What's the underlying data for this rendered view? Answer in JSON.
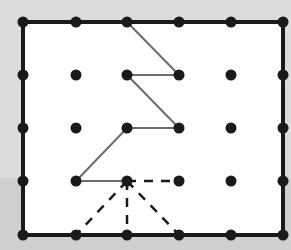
{
  "diagram": {
    "type": "dot-grid-path",
    "grid": {
      "columns": [
        23,
        76,
        127,
        179,
        231,
        283
      ],
      "rows": [
        22,
        75,
        128,
        181,
        235
      ]
    },
    "frame": {
      "x1": 23,
      "y1": 22,
      "x2": 283,
      "y2": 235,
      "stroke": "#1a1a1a",
      "width": 4
    },
    "dot_color": "#1a1a1a",
    "dot_radius": 5.5,
    "solid_path": [
      [
        127,
        22
      ],
      [
        179,
        75
      ],
      [
        127,
        75
      ],
      [
        179,
        128
      ],
      [
        127,
        128
      ],
      [
        76,
        181
      ],
      [
        127,
        181
      ]
    ],
    "solid_color": "#6a6a6a",
    "dashed_segments": [
      [
        [
          127,
          181
        ],
        [
          179,
          181
        ]
      ],
      [
        [
          127,
          181
        ],
        [
          76,
          235
        ]
      ],
      [
        [
          127,
          181
        ],
        [
          127,
          235
        ]
      ],
      [
        [
          127,
          181
        ],
        [
          179,
          235
        ]
      ]
    ],
    "dashed_color": "#1a1a1a",
    "colors": {
      "background_top": "#dcdcdc",
      "background_bottom": "#cfcfcf",
      "interior": "#ffffff"
    }
  }
}
